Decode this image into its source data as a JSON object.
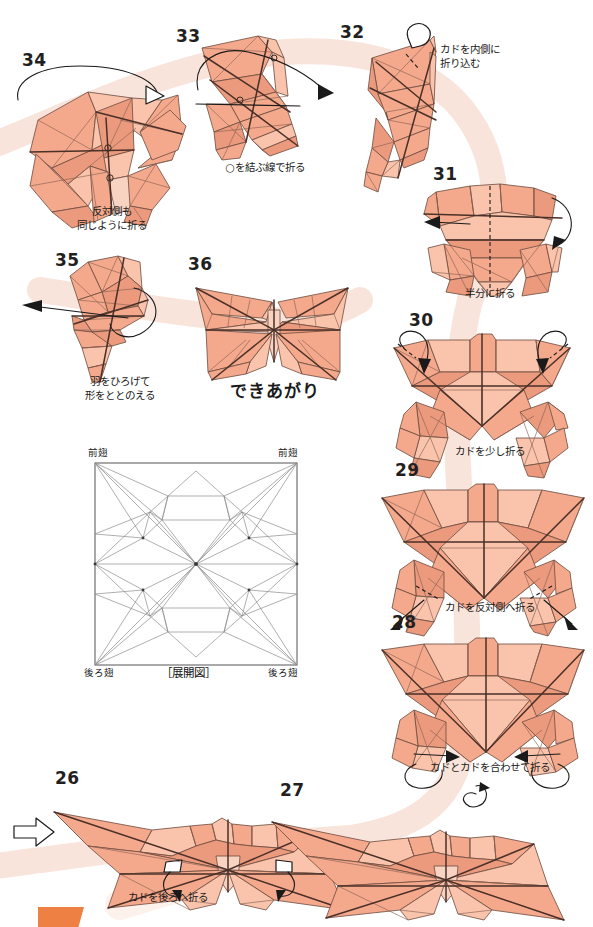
{
  "page": {
    "language": "ja",
    "background_color": "#ffffff",
    "paper_color": "#f5a98c",
    "paper_shade_color": "#efc0ae",
    "paper_light_color": "#fbd9c9",
    "line_color": "#5a4038",
    "ribbon_color": "#f9e4db",
    "number_color": "#231f20",
    "tab_color": "#ef8043"
  },
  "steps": [
    {
      "id": "step-34",
      "number": "34",
      "caption": "反対側も\n同じように折る",
      "caption_romaji": "hantaigawa mo onaji you ni oru"
    },
    {
      "id": "step-33",
      "number": "33",
      "caption": "○を結ぶ線で折る",
      "caption_romaji": "maru o musubu sen de oru"
    },
    {
      "id": "step-32",
      "number": "32",
      "caption": "カドを内側に\n折り込む",
      "caption_romaji": "kado o uchigawa ni orikomu"
    },
    {
      "id": "step-31",
      "number": "31",
      "caption": "半分に折る",
      "caption_romaji": "hanbun ni oru"
    },
    {
      "id": "step-30",
      "number": "30",
      "caption": "カドを少し折る",
      "caption_romaji": "kado o sukoshi oru"
    },
    {
      "id": "step-29",
      "number": "29",
      "caption": "カドを反対側へ折る",
      "caption_romaji": "kado o hantaigawa e oru"
    },
    {
      "id": "step-28",
      "number": "28",
      "caption": "カドとカドを合わせて折る",
      "caption_romaji": "kado to kado o awasete oru"
    },
    {
      "id": "step-27",
      "number": "27",
      "caption": ""
    },
    {
      "id": "step-26",
      "number": "26",
      "caption": "カドを後ろへ折る",
      "caption_romaji": "kado o ushiro e oru"
    },
    {
      "id": "step-35",
      "number": "35",
      "caption": "羽をひろげて\n形をととのえる",
      "caption_romaji": "hane o hirogete katachi o totonoeru"
    },
    {
      "id": "step-36",
      "number": "36",
      "caption": "できあがり",
      "caption_romaji": "dekiagari"
    }
  ],
  "crease_pattern": {
    "title": "［展開図］",
    "label_top_left": "前翅",
    "label_top_right": "前翅",
    "label_bottom_left": "後ろ翅",
    "label_bottom_right": "後ろ翅"
  }
}
